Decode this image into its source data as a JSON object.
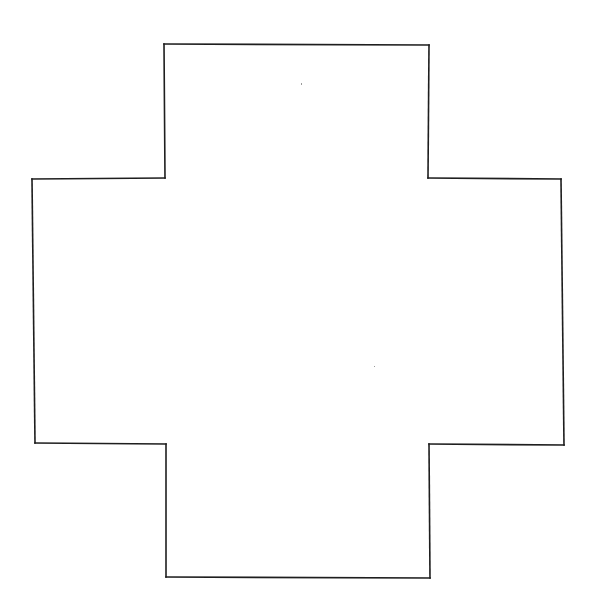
{
  "figure": {
    "shape": "greek-cross",
    "arm_count": 4,
    "stroke_color": "#1e1e1e",
    "fill_color": "#ffffff",
    "background_color": "#ffffff",
    "text_labels": []
  }
}
